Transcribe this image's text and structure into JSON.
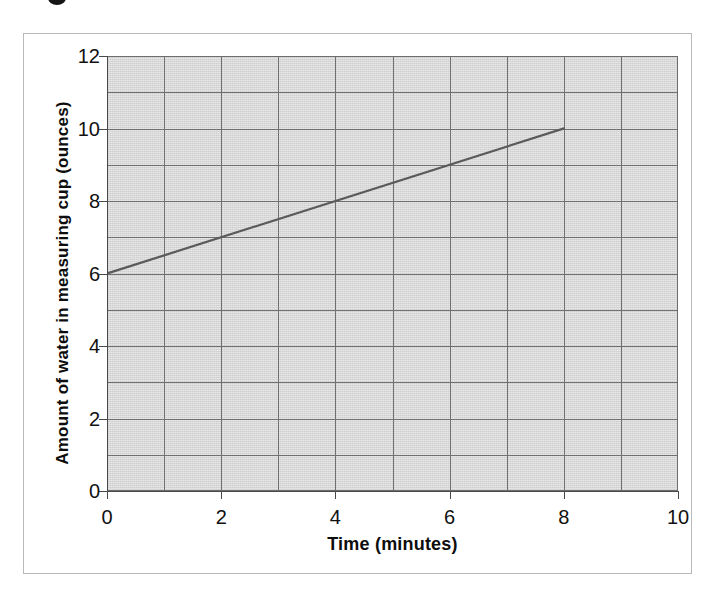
{
  "figure": {
    "background_color": "#ffffff",
    "frame_border_color": "#b9b9b9",
    "plot_background_color": "#d9d9d9",
    "gridline_color": "#707070",
    "axis_color": "#4a4a4a",
    "series_color": "#5a5a5a"
  },
  "artifact": {
    "top_mark_label": "cropped-ink-mark"
  },
  "chart_data": {
    "type": "line",
    "title": "",
    "xlabel": "Time (minutes)",
    "ylabel": "Amount of water in measuring cup (ounces)",
    "xlim": [
      0,
      10
    ],
    "ylim": [
      0,
      12
    ],
    "x_tick_labels": [
      "0",
      "2",
      "4",
      "6",
      "8",
      "10"
    ],
    "x_tick_values": [
      0,
      2,
      4,
      6,
      8,
      10
    ],
    "y_tick_labels": [
      "0",
      "2",
      "4",
      "6",
      "8",
      "10",
      "12"
    ],
    "y_tick_values": [
      0,
      2,
      4,
      6,
      8,
      10,
      12
    ],
    "x_gridline_values": [
      0,
      1,
      2,
      3,
      4,
      5,
      6,
      7,
      8,
      9,
      10
    ],
    "y_gridline_values": [
      0,
      1,
      2,
      3,
      4,
      5,
      6,
      7,
      8,
      9,
      10,
      11,
      12
    ],
    "grid": true,
    "legend": false,
    "legend_position": "none",
    "series": [
      {
        "name": "water amount",
        "x": [
          0,
          8
        ],
        "values": [
          6,
          10
        ],
        "slope_per_minute": 0.5,
        "y_intercept": 6
      }
    ]
  }
}
